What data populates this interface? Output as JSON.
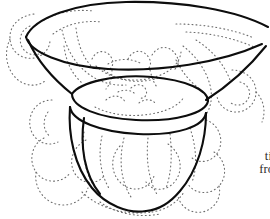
{
  "figure": {
    "kind": "line-drawing-illustration",
    "background_color": "#ffffff",
    "outline_color": "#0d0d0d",
    "stipple_color": "#6e6e6e",
    "outline_width_px": 2.1,
    "stipple_width_px": 1.1,
    "stipple_dash": "0.9 3.1"
  },
  "caption": {
    "lines": [
      "il",
      "tinc",
      "from"
    ],
    "color": "#2b2b2b",
    "alignment": "right",
    "clipped_at_right_edge": true
  },
  "canvas": {
    "width": 270,
    "height": 219
  }
}
